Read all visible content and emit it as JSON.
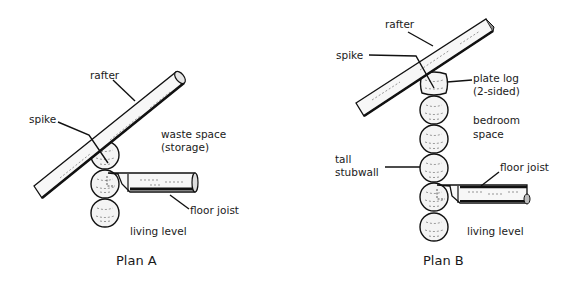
{
  "diagrams": [
    {
      "id": "plan-a",
      "caption": "Plan A",
      "labels": {
        "rafter": "rafter",
        "spike": "spike",
        "space_line1": "waste space",
        "space_line2": "(storage)",
        "floor_joist": "floor joist",
        "living_level": "living level"
      },
      "log_count": 3
    },
    {
      "id": "plan-b",
      "caption": "Plan B",
      "labels": {
        "rafter": "rafter",
        "spike": "spike",
        "plate_line1": "plate log",
        "plate_line2": "(2-sided)",
        "space_line1": "bedroom",
        "space_line2": "space",
        "stubwall_line1": "tall",
        "stubwall_line2": "stubwall",
        "floor_joist": "floor joist",
        "living_level": "living level"
      },
      "log_count": 6
    }
  ],
  "colors": {
    "ink": "#111111",
    "wood_fill": "#f4f4f4",
    "background": "#ffffff"
  }
}
